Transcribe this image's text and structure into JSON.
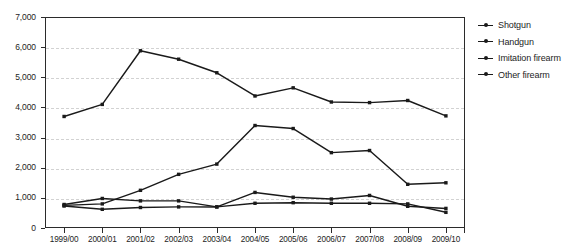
{
  "chart_data": {
    "type": "line",
    "title": "",
    "subtitle": "",
    "xlabel": "",
    "ylabel": "",
    "ylim": [
      0,
      7000
    ],
    "y_ticks": [
      0,
      1000,
      2000,
      3000,
      4000,
      5000,
      6000,
      7000
    ],
    "y_tick_labels": [
      "0",
      "1,000",
      "2,000",
      "3,000",
      "4,000",
      "5,000",
      "6,000",
      "7,000"
    ],
    "grid": true,
    "grid_axis": "y",
    "legend_position": "right",
    "categories": [
      "1999/00",
      "2000/01",
      "2001/02",
      "2002/03",
      "2003/04",
      "2004/05",
      "2005/06",
      "2006/07",
      "2007/08",
      "2008/09",
      "2009/10"
    ],
    "series": [
      {
        "name": "Shotgun",
        "color": "#1a1a1a",
        "values": [
          780,
          980,
          900,
          900,
          700,
          1180,
          1020,
          960,
          1080,
          720,
          650
        ]
      },
      {
        "name": "Handgun",
        "color": "#1a1a1a",
        "values": [
          3700,
          4100,
          5880,
          5600,
          5150,
          4380,
          4650,
          4180,
          4160,
          4230,
          3720
        ]
      },
      {
        "name": "Imitation firearm",
        "color": "#1a1a1a",
        "values": [
          750,
          800,
          1250,
          1780,
          2120,
          3400,
          3300,
          2500,
          2570,
          1450,
          1500
        ]
      },
      {
        "name": "Other firearm",
        "color": "#1a1a1a",
        "values": [
          730,
          620,
          680,
          700,
          700,
          820,
          840,
          820,
          820,
          800,
          520
        ]
      }
    ]
  },
  "legend": {
    "items": [
      {
        "label": "Shotgun"
      },
      {
        "label": "Handgun"
      },
      {
        "label": "Imitation firearm"
      },
      {
        "label": "Other firearm"
      }
    ]
  }
}
